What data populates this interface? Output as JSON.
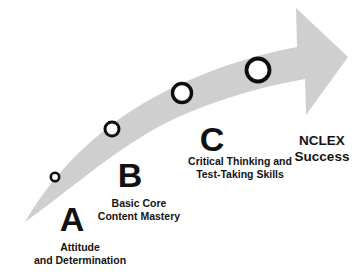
{
  "diagram": {
    "arrow": {
      "name": "upward-curving-arrow",
      "fill_color": "#cfcfcf",
      "direction": "lower-left to upper-right"
    },
    "steps": [
      {
        "letter": "A",
        "caption_line1": "Attitude",
        "caption_line2": "and Determination",
        "marker": {
          "cx": 55,
          "cy": 177,
          "r": 4.2,
          "stroke_width": 2.6
        },
        "letter_x": 72,
        "letter_y": 232,
        "caption_x": 80,
        "caption_y": 241
      },
      {
        "letter": "B",
        "caption_line1": "Basic Core",
        "caption_line2": "Content Mastery",
        "marker": {
          "cx": 112,
          "cy": 129,
          "r": 7.0,
          "stroke_width": 3.0
        },
        "letter_x": 130,
        "letter_y": 188,
        "caption_x": 139,
        "caption_y": 197
      },
      {
        "letter": "C",
        "caption_line1": "Critical Thinking and",
        "caption_line2": "Test-Taking Skills",
        "marker": {
          "cx": 182,
          "cy": 93,
          "r": 9.5,
          "stroke_width": 3.4
        },
        "letter_x": 212,
        "letter_y": 152,
        "caption_x": 240,
        "caption_y": 155
      }
    ],
    "final_marker": {
      "cx": 258,
      "cy": 70,
      "r": 11.5,
      "stroke_width": 3.8
    },
    "goal": {
      "line1": "NCLEX",
      "line2": "Success",
      "x": 322,
      "y": 133
    },
    "colors": {
      "arrow_gray": "#cfcfcf",
      "text_black": "#141414",
      "marker_fill": "#ffffff",
      "marker_stroke": "#0d0d0d",
      "background": "#ffffff"
    }
  }
}
